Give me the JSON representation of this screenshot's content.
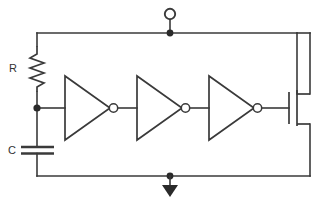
{
  "diagram": {
    "background_color": "#ffffff",
    "line_color": "#3a3a3a",
    "node_fill_color": "#2a2a2a"
  },
  "labels": {
    "resistor": "R",
    "capacitor": "C"
  },
  "components": [
    {
      "id": "resistor-r",
      "type": "resistor",
      "label": "R",
      "orientation": "vertical",
      "zigzag_peaks": 6,
      "x": 37,
      "y_top": 46,
      "y_bottom": 92
    },
    {
      "id": "capacitor-c",
      "type": "capacitor",
      "label": "C",
      "orientation": "horizontal-plates",
      "plates": 2,
      "x": 37,
      "y_top_plate": 147,
      "y_bottom_plate": 153
    },
    {
      "id": "inverter-1",
      "type": "inverter",
      "label": "",
      "input_x": 65,
      "output_x": 114,
      "center_y": 108
    },
    {
      "id": "inverter-2",
      "type": "inverter",
      "label": "",
      "input_x": 137,
      "output_x": 186,
      "center_y": 108
    },
    {
      "id": "inverter-3",
      "type": "inverter",
      "label": "",
      "input_x": 209,
      "output_x": 258,
      "center_y": 108
    },
    {
      "id": "mosfet-q1",
      "type": "mosfet-n-channel",
      "label": "",
      "gate_x": 289,
      "channel_x": 297,
      "drain_y": 94,
      "source_y": 124
    }
  ],
  "terminals": [
    {
      "id": "output-terminal",
      "type": "open-circle-terminal",
      "label": "",
      "x": 170,
      "y": 14
    },
    {
      "id": "ground-terminal",
      "type": "ground-arrow",
      "label": "",
      "x": 170,
      "y": 183
    }
  ],
  "junctions": [
    {
      "id": "junction-supply-rail",
      "x": 170,
      "y": 33
    },
    {
      "id": "junction-rc-node",
      "x": 37,
      "y": 108
    },
    {
      "id": "junction-ground-rail",
      "x": 170,
      "y": 176
    }
  ],
  "nets": [
    {
      "id": "net-supply",
      "name": "top rail",
      "from": "resistor top",
      "to": "mosfet drain"
    },
    {
      "id": "net-rc",
      "name": "RC node",
      "from": "R / C junction",
      "to": "inverter-1 input"
    },
    {
      "id": "net-inv1-inv2",
      "name": "stage 1 to 2",
      "from": "inverter-1 output",
      "to": "inverter-2 input"
    },
    {
      "id": "net-inv2-inv3",
      "name": "stage 2 to 3",
      "from": "inverter-2 output",
      "to": "inverter-3 input"
    },
    {
      "id": "net-inv3-gate",
      "name": "stage 3 to gate",
      "from": "inverter-3 output",
      "to": "mosfet gate"
    },
    {
      "id": "net-ground",
      "name": "bottom rail",
      "from": "capacitor bottom",
      "to": "mosfet source"
    }
  ],
  "caption": {
    "text": ""
  }
}
